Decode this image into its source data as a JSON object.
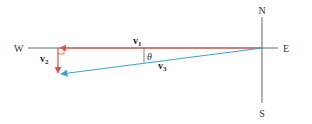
{
  "diagram": {
    "compass": {
      "north": "N",
      "south": "S",
      "east": "E",
      "west": "W"
    },
    "vectors": [
      {
        "name": "v",
        "subscript": "1",
        "color": "#e2513f",
        "direction": "west"
      },
      {
        "name": "v",
        "subscript": "2",
        "color": "#e2513f",
        "direction": "south"
      },
      {
        "name": "v",
        "subscript": "3",
        "color": "#3aa3d4",
        "direction": "west-southwest (resultant)"
      }
    ],
    "angle_label": "θ",
    "colors": {
      "axis": "#555555",
      "v1_v2": "#e2513f",
      "v3": "#3aa3d4",
      "right_angle_marker": "#e2513f"
    }
  }
}
